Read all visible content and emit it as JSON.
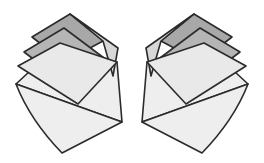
{
  "figure": {
    "width": 264,
    "height": 163,
    "background_color": "#ffffff",
    "stroke_color": "#2b2b2b",
    "stroke_width": 1.6,
    "palette": {
      "dark_gray": "#a8a8a8",
      "mid_gray": "#b5b5b5",
      "light_gray": "#d8d8d8",
      "pale_gray": "#e9e9e9",
      "base_gray": "#eeeeee",
      "outline": "#2b2b2b",
      "white": "#ffffff"
    },
    "groups": [
      {
        "name": "left-fan",
        "mirrored": false,
        "pivot": {
          "x": 16,
          "y": 84
        },
        "shapes": [
          {
            "name": "base-panel",
            "fill_key": "base_gray",
            "path": "M 16 84 L 57 46 L 117 62 L 122 122 Z"
          },
          {
            "name": "lower-tail-panel",
            "fill_key": "base_gray",
            "path": "M 16 84 L 122 122 L 62 153 Q 30 120 16 84 Z"
          },
          {
            "name": "flap-dark-top",
            "fill_key": "dark_gray",
            "path": "M 32 37 L 70 14 L 103 41 L 64 62 Z"
          },
          {
            "name": "flap-dark-upper-right",
            "fill_key": "light_gray",
            "path": "M 70 14 L 118 48 L 113 76 L 103 41 Z"
          },
          {
            "name": "flap-mid",
            "fill_key": "mid_gray",
            "path": "M 24 52 L 64 28 L 112 64 L 72 88 Z"
          },
          {
            "name": "flap-light",
            "fill_key": "pale_gray",
            "path": "M 18 66 L 60 43 L 117 62 L 78 104 Z"
          }
        ]
      },
      {
        "name": "right-fan",
        "mirrored": true,
        "pivot": {
          "x": 248,
          "y": 84
        },
        "shapes": [
          {
            "name": "base-panel",
            "fill_key": "base_gray",
            "path": "M 16 84 L 57 46 L 117 62 L 122 122 Z"
          },
          {
            "name": "lower-tail-panel",
            "fill_key": "base_gray",
            "path": "M 16 84 L 122 122 L 62 153 Q 30 120 16 84 Z"
          },
          {
            "name": "flap-dark-top",
            "fill_key": "dark_gray",
            "path": "M 32 37 L 70 14 L 103 41 L 64 62 Z"
          },
          {
            "name": "flap-dark-upper-right",
            "fill_key": "light_gray",
            "path": "M 70 14 L 118 48 L 113 76 L 103 41 Z"
          },
          {
            "name": "flap-mid",
            "fill_key": "mid_gray",
            "path": "M 24 52 L 64 28 L 112 64 L 72 88 Z"
          },
          {
            "name": "flap-light",
            "fill_key": "pale_gray",
            "path": "M 18 66 L 60 43 L 117 62 L 78 104 Z"
          }
        ]
      }
    ]
  }
}
